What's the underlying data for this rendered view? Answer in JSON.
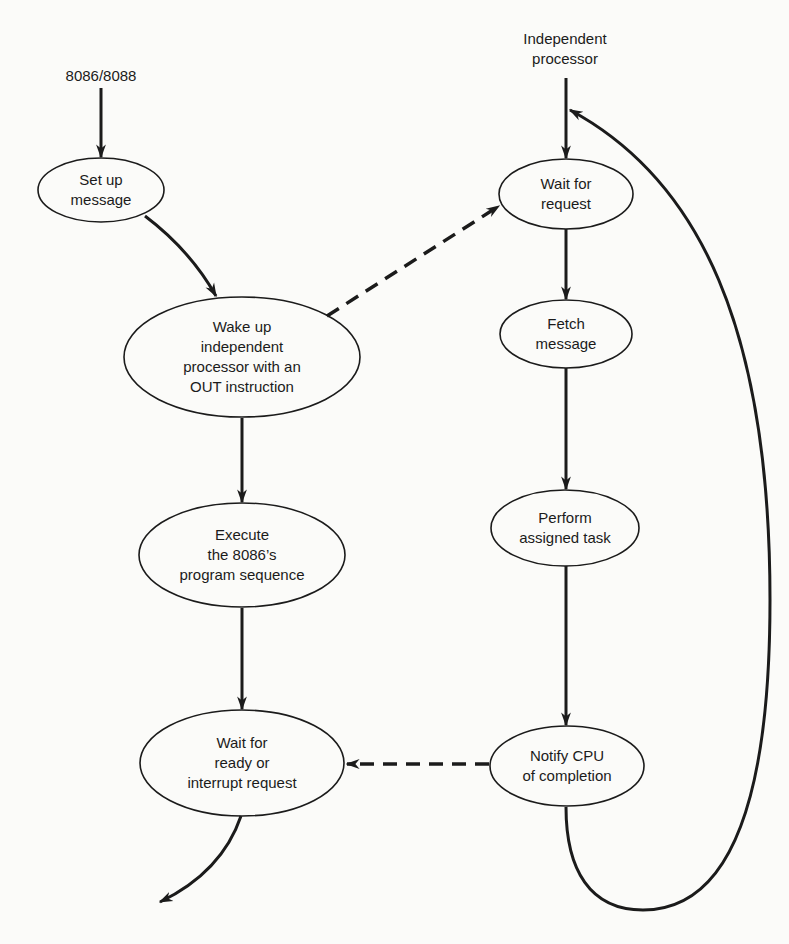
{
  "diagram": {
    "type": "flowchart",
    "colors": {
      "background": "#fbfbf9",
      "stroke": "#1b1b1b",
      "text": "#1b1b1b"
    },
    "left_column": {
      "start_label": "8086/8088",
      "nodes": [
        {
          "id": "setup",
          "lines": [
            "Set up",
            "message"
          ]
        },
        {
          "id": "wake",
          "lines": [
            "Wake up",
            "independent",
            "processor with an",
            "OUT instruction"
          ]
        },
        {
          "id": "execute",
          "lines": [
            "Execute",
            "the 8086’s",
            "program sequence"
          ]
        },
        {
          "id": "waitready",
          "lines": [
            "Wait for",
            "ready or",
            "interrupt request"
          ]
        }
      ]
    },
    "right_column": {
      "start_label": [
        "Independent",
        "processor"
      ],
      "nodes": [
        {
          "id": "waitreq",
          "lines": [
            "Wait for",
            "request"
          ]
        },
        {
          "id": "fetch",
          "lines": [
            "Fetch",
            "message"
          ]
        },
        {
          "id": "perform",
          "lines": [
            "Perform",
            "assigned task"
          ]
        },
        {
          "id": "notify",
          "lines": [
            "Notify CPU",
            "of completion"
          ]
        }
      ]
    },
    "edges": [
      {
        "from": "8086/8088",
        "to": "setup",
        "style": "solid"
      },
      {
        "from": "setup",
        "to": "wake",
        "style": "solid"
      },
      {
        "from": "wake",
        "to": "waitreq",
        "style": "dashed"
      },
      {
        "from": "wake",
        "to": "execute",
        "style": "solid"
      },
      {
        "from": "execute",
        "to": "waitready",
        "style": "solid"
      },
      {
        "from": "waitready",
        "to": "exit",
        "style": "solid"
      },
      {
        "from": "Independent processor",
        "to": "waitreq",
        "style": "solid"
      },
      {
        "from": "waitreq",
        "to": "fetch",
        "style": "solid"
      },
      {
        "from": "fetch",
        "to": "perform",
        "style": "solid"
      },
      {
        "from": "perform",
        "to": "notify",
        "style": "solid"
      },
      {
        "from": "notify",
        "to": "waitready",
        "style": "dashed"
      },
      {
        "from": "notify",
        "to": "waitreq",
        "style": "solid-loop"
      }
    ]
  }
}
